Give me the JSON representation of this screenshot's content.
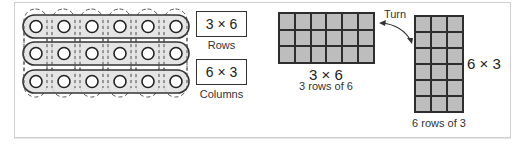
{
  "counters_array": {
    "rows": 3,
    "columns": 6,
    "row_fill": "#e0e0e0",
    "outline_color": "#333333"
  },
  "expression_boxes": [
    {
      "expression": "3 × 6",
      "caption": "Rows"
    },
    {
      "expression": "6 × 3",
      "caption": "Columns"
    }
  ],
  "horizontal_grid": {
    "rows": 3,
    "columns": 6,
    "expression": "3 × 6",
    "caption": "3 rows of 6"
  },
  "turn_label": "Turn",
  "vertical_grid": {
    "rows": 6,
    "columns": 3,
    "expression": "6 × 3",
    "caption": "6 rows of 3"
  },
  "colors": {
    "cell_fill": "#bdbdbd",
    "cell_border": "#2e2e2e",
    "frame_border": "#cfcfcf"
  }
}
